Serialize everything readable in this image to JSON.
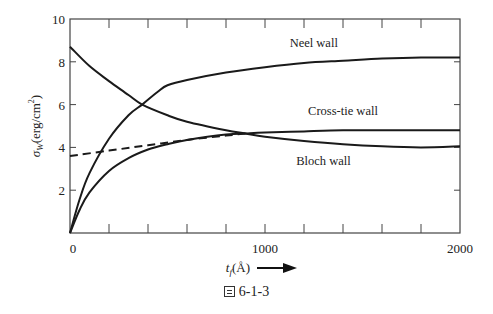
{
  "chart_data": {
    "type": "line",
    "title": "",
    "xlabel": "t_f(Å)",
    "xlabel_main": "t",
    "xlabel_sub": "f",
    "xlabel_unit": "(Å)",
    "xlabel_arrow": true,
    "ylabel": "σ_W (erg/cm²)",
    "ylabel_main": "σ",
    "ylabel_sub": "W",
    "ylabel_unit": "(erg/cm",
    "ylabel_sup": "2",
    "ylabel_close": ")",
    "xlim": [
      0,
      2000
    ],
    "ylim": [
      0,
      10
    ],
    "xticks_labeled": [
      0,
      1000,
      2000
    ],
    "xtick_labels": [
      "0",
      "1000",
      "2000"
    ],
    "xtick_minor_step": 200,
    "yticks": [
      2,
      4,
      6,
      8,
      10
    ],
    "ytick_labels": [
      "2",
      "4",
      "6",
      "8",
      "10"
    ],
    "grid": false,
    "legend": "inline labels",
    "series": [
      {
        "name": "Neel wall",
        "style": "solid",
        "x": [
          0,
          50,
          100,
          200,
          300,
          370,
          450,
          500,
          600,
          800,
          1000,
          1200,
          1400,
          1600,
          1800,
          2000
        ],
        "y": [
          0,
          1.6,
          2.8,
          4.4,
          5.5,
          6.0,
          6.6,
          6.9,
          7.15,
          7.5,
          7.75,
          7.95,
          8.05,
          8.15,
          8.2,
          8.2
        ]
      },
      {
        "name": "Bloch wall",
        "style": "solid",
        "x": [
          0,
          100,
          200,
          300,
          370,
          500,
          600,
          800,
          900,
          1000,
          1200,
          1400,
          1600,
          1800,
          2000
        ],
        "y": [
          8.7,
          7.8,
          7.1,
          6.45,
          6.0,
          5.5,
          5.2,
          4.8,
          4.65,
          4.5,
          4.3,
          4.15,
          4.05,
          4.0,
          4.05
        ]
      },
      {
        "name": "Cross-tie wall",
        "style": "solid",
        "x": [
          0,
          50,
          100,
          200,
          300,
          400,
          500,
          600,
          800,
          900,
          1000,
          1200,
          1400,
          1600,
          1800,
          2000
        ],
        "y": [
          0,
          1.1,
          1.9,
          2.9,
          3.5,
          3.9,
          4.15,
          4.35,
          4.6,
          4.65,
          4.7,
          4.75,
          4.8,
          4.8,
          4.8,
          4.8
        ]
      },
      {
        "name": "Cross-tie (dashed extension)",
        "style": "dashed",
        "x": [
          0,
          200,
          400,
          600,
          800,
          900
        ],
        "y": [
          3.6,
          3.85,
          4.1,
          4.35,
          4.55,
          4.65
        ]
      }
    ],
    "annotations": [
      {
        "text": "Neel wall",
        "x": 1250,
        "y": 8.7
      },
      {
        "text": "Cross-tie wall",
        "x": 1400,
        "y": 5.5
      },
      {
        "text": "Bloch wall",
        "x": 1300,
        "y": 3.2
      }
    ]
  },
  "caption": {
    "figure_label": "6-1-3"
  }
}
